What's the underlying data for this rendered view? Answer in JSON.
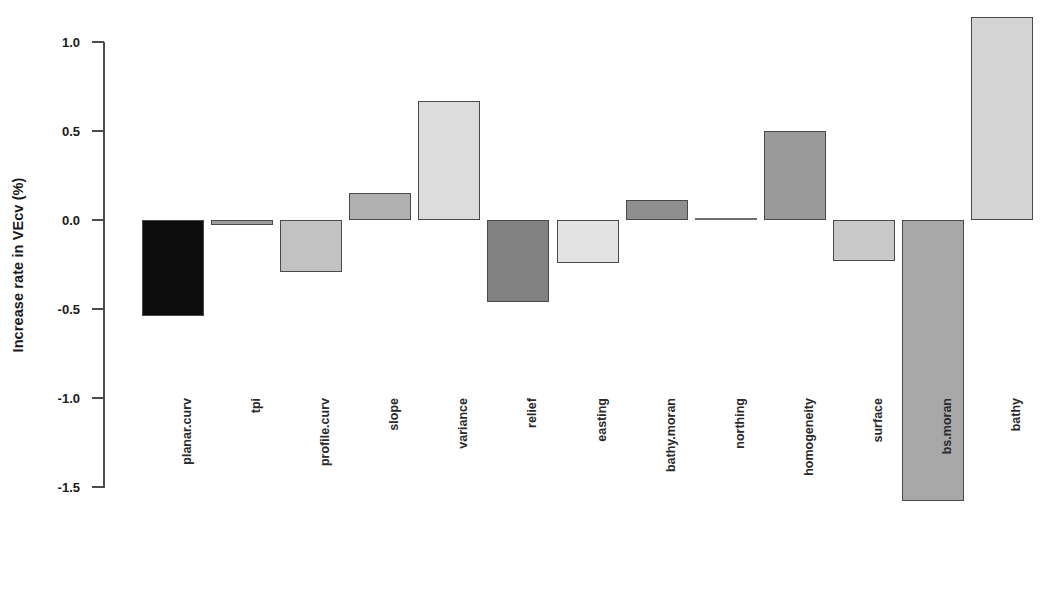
{
  "chart_data": {
    "type": "bar",
    "title": "",
    "subtitle": "",
    "xlabel": "",
    "ylabel": "Increase rate in VEcv (%)",
    "grid": false,
    "legend": "none",
    "orientation": "vertical",
    "ylim": [
      -1.65,
      1.18
    ],
    "yticks": [
      "1.0",
      "0.5",
      "0.0",
      "-0.5",
      "-1.0",
      "-1.5"
    ],
    "ytick_values": [
      1.0,
      0.5,
      0.0,
      -0.5,
      -1.0,
      -1.5
    ],
    "categories": [
      "planar.curv",
      "tpi",
      "profile.curv",
      "slope",
      "variance",
      "relief",
      "easting",
      "bathy.moran",
      "northing",
      "homogeneity",
      "surface",
      "bs.moran",
      "bathy"
    ],
    "values": [
      -0.54,
      -0.03,
      -0.29,
      0.15,
      0.67,
      -0.46,
      -0.24,
      0.11,
      0.01,
      0.5,
      -0.23,
      -1.58,
      1.14
    ],
    "bar_colors": [
      "#0d0d0d",
      "#9c9c9c",
      "#c2c2c2",
      "#b0b0b0",
      "#dcdcdc",
      "#818181",
      "#e3e3e3",
      "#8f8f8f",
      "#6e6e6e",
      "#9a9a9a",
      "#c9c9c9",
      "#a8a8a8",
      "#d4d4d4"
    ],
    "bar_edge_color": "#4a4a4a",
    "axis_color": "#4d4d4d",
    "background_color": "#ffffff"
  },
  "axis": {
    "y_label_text": "Increase rate in VEcv (%)"
  }
}
